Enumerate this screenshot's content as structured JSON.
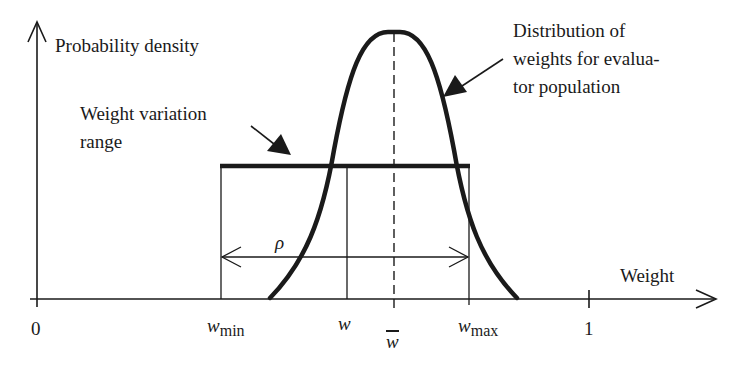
{
  "diagram": {
    "y_axis_label": "Probability density",
    "x_axis_label": "Weight",
    "curve_annotation": {
      "line1": "Distribution of",
      "line2": "weights for evalua-",
      "line3": "tor population"
    },
    "range_annotation": {
      "line1": "Weight variation",
      "line2": "range"
    },
    "rho_label": "ρ",
    "ticks": {
      "zero": "0",
      "one": "1",
      "w_min_base": "w",
      "w_min_sub": "min",
      "w": "w",
      "w_bar": "w",
      "w_max_base": "w",
      "w_max_sub": "max"
    },
    "colors": {
      "ink": "#1a1a1a",
      "background": "#ffffff"
    }
  }
}
